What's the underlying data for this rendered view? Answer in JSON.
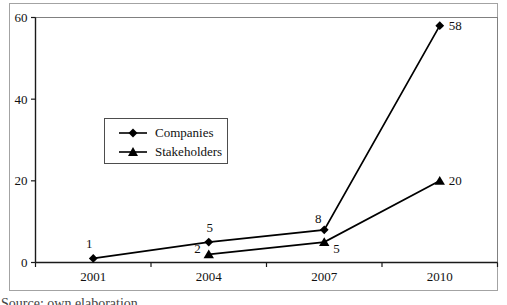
{
  "chart_data": {
    "type": "line",
    "categories": [
      "2001",
      "2004",
      "2007",
      "2010"
    ],
    "series": [
      {
        "name": "Companies",
        "marker": "diamond",
        "values": [
          1,
          5,
          8,
          58
        ]
      },
      {
        "name": "Stakeholders",
        "marker": "triangle",
        "values": [
          null,
          2,
          5,
          20
        ]
      }
    ],
    "title": "",
    "xlabel": "",
    "ylabel": "",
    "ylim": [
      0,
      60
    ],
    "yticks": [
      0,
      20,
      40,
      60
    ],
    "grid": false,
    "data_labels": true,
    "legend_position": "inside-left",
    "line_color": "#000000",
    "marker_color": "#000000",
    "plot_border_color": "#808080",
    "axis_color": "#1a1a1a",
    "frame_border_color": "#a3a3a3"
  },
  "legend": {
    "items": [
      {
        "label": "Companies"
      },
      {
        "label": "Stakeholders"
      }
    ]
  },
  "caption": {
    "text": "Source: own elaboration"
  }
}
